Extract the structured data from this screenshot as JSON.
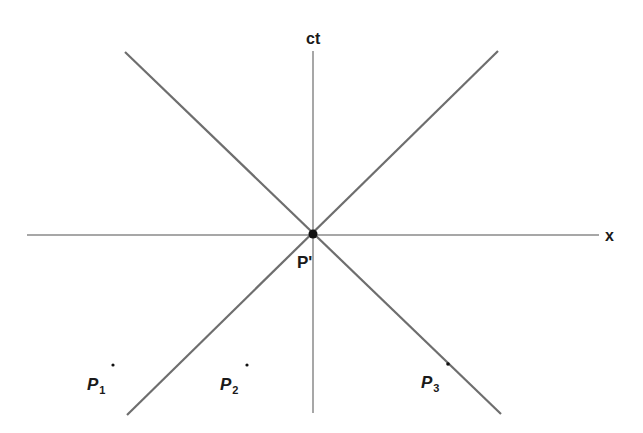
{
  "diagram": {
    "colors": {
      "axis": "#8a8a8a",
      "light_cone": "#6e6e6e",
      "point": "#111111",
      "text": "#1a1a1a",
      "background": "#ffffff"
    },
    "axes": {
      "time_label": "ct",
      "space_label": "x"
    },
    "origin": {
      "label": "P'"
    },
    "points": [
      {
        "name": "P",
        "subscript": "1"
      },
      {
        "name": "P",
        "subscript": "2"
      },
      {
        "name": "P",
        "subscript": "3"
      }
    ]
  }
}
